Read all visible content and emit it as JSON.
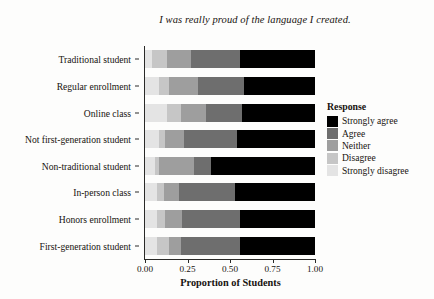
{
  "chart_data": {
    "type": "bar",
    "orientation": "horizontal",
    "stacked": true,
    "normalized": true,
    "title": "I was really proud of the language I created.",
    "xlabel": "Proportion of Students",
    "ylabel": "",
    "xlim": [
      0.0,
      1.0
    ],
    "xticks": [
      0.0,
      0.25,
      0.5,
      0.75,
      1.0
    ],
    "xticklabels": [
      "0.00",
      "0.25",
      "0.50",
      "0.75",
      "1.00"
    ],
    "grid": false,
    "legend_title": "Response",
    "legend_position": "right",
    "legend_order": [
      "Strongly agree",
      "Agree",
      "Neither",
      "Disagree",
      "Strongly disagree"
    ],
    "stack_order": [
      "Strongly disagree",
      "Disagree",
      "Neither",
      "Agree",
      "Strongly agree"
    ],
    "colors": {
      "Strongly agree": "#000000",
      "Agree": "#6e6e6e",
      "Neither": "#9e9e9e",
      "Disagree": "#c6c6c6",
      "Strongly disagree": "#e4e4e4"
    },
    "categories": [
      "Traditional student",
      "Regular enrollment",
      "Online class",
      "Not first-generation student",
      "Non-traditional student",
      "In-person class",
      "Honors enrollment",
      "First-generation student"
    ],
    "series": [
      {
        "name": "Strongly disagree",
        "values": [
          0.04,
          0.08,
          0.13,
          0.08,
          0.06,
          0.07,
          0.07,
          0.07
        ]
      },
      {
        "name": "Disagree",
        "values": [
          0.09,
          0.06,
          0.08,
          0.04,
          0.02,
          0.04,
          0.05,
          0.07
        ]
      },
      {
        "name": "Neither",
        "values": [
          0.14,
          0.17,
          0.15,
          0.11,
          0.21,
          0.09,
          0.1,
          0.07
        ]
      },
      {
        "name": "Agree",
        "values": [
          0.29,
          0.27,
          0.21,
          0.31,
          0.1,
          0.33,
          0.34,
          0.35
        ]
      },
      {
        "name": "Strongly agree",
        "values": [
          0.44,
          0.42,
          0.43,
          0.46,
          0.61,
          0.47,
          0.44,
          0.44
        ]
      }
    ]
  }
}
